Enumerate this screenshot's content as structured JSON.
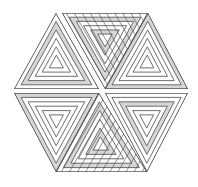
{
  "figure": {
    "width": 198,
    "height": 187,
    "colors": {
      "background": "#ffffff",
      "stroke": "#4a4a4a",
      "shade": "#d6d6d6",
      "light": "#ffffff"
    },
    "hexagon": {
      "center": [
        101,
        91
      ],
      "vertices": [
        [
          56,
          13
        ],
        [
          147,
          13
        ],
        [
          188,
          89
        ],
        [
          147,
          172
        ],
        [
          56,
          172
        ],
        [
          14,
          89
        ]
      ]
    },
    "triangles": [
      {
        "name": "upper-left",
        "points": [
          [
            14,
            89
          ],
          [
            56,
            13
          ],
          [
            99,
            89
          ]
        ],
        "stripe_angle": 0,
        "shaded_bands": [
          1
        ]
      },
      {
        "name": "upper-middle",
        "points": [
          [
            62,
            13
          ],
          [
            148,
            13
          ],
          [
            105,
            89
          ]
        ],
        "stripe_angle": 60,
        "shaded_bands": [
          1,
          4
        ]
      },
      {
        "name": "upper-right",
        "points": [
          [
            105,
            89
          ],
          [
            148,
            13
          ],
          [
            188,
            89
          ]
        ],
        "stripe_angle": 0,
        "shaded_bands": [
          0
        ]
      },
      {
        "name": "lower-left",
        "points": [
          [
            14,
            93
          ],
          [
            99,
            93
          ],
          [
            56,
            172
          ]
        ],
        "stripe_angle": 0,
        "shaded_bands": [
          0
        ]
      },
      {
        "name": "lower-middle",
        "points": [
          [
            99,
            93
          ],
          [
            56,
            172
          ],
          [
            147,
            172
          ]
        ],
        "stripe_angle": -60,
        "shaded_bands": [
          1,
          4
        ]
      },
      {
        "name": "lower-right",
        "points": [
          [
            105,
            93
          ],
          [
            188,
            93
          ],
          [
            147,
            172
          ]
        ],
        "stripe_angle": 0,
        "shaded_bands": [
          2
        ]
      }
    ]
  }
}
